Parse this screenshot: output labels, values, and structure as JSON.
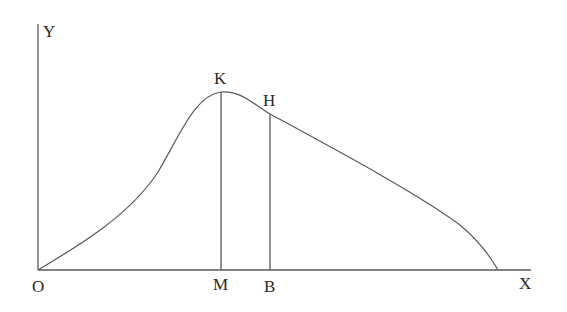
{
  "diagram": {
    "labels": {
      "y_axis": "Y",
      "x_axis": "X",
      "origin": "O",
      "peak_point": "K",
      "curve_point": "H",
      "peak_foot": "M",
      "curve_foot": "B"
    },
    "geometry": {
      "origin": [
        38,
        270
      ],
      "y_axis_top": [
        38,
        24
      ],
      "x_axis_end": [
        531,
        270
      ],
      "K": [
        221,
        92
      ],
      "M": [
        221,
        270
      ],
      "H": [
        270,
        114
      ],
      "B": [
        270,
        270
      ],
      "curve_end": [
        498,
        270
      ]
    },
    "colors": {
      "stroke": "#5a5a5a",
      "text": "#2a2a2a",
      "background": "#ffffff"
    }
  }
}
